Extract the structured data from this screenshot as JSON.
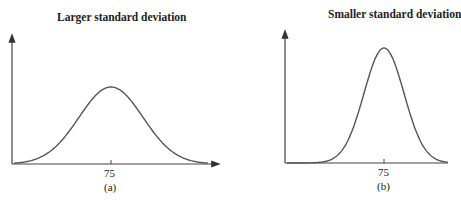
{
  "panels": [
    {
      "title": "Larger standard deviation",
      "tick": "75",
      "caption": "(a)"
    },
    {
      "title": "Smaller standard deviation",
      "tick": "75",
      "caption": "(b)"
    }
  ],
  "chart_data": [
    {
      "type": "line",
      "title": "Larger standard deviation",
      "subtitle": "(a)",
      "xlabel": "",
      "ylabel": "",
      "x_ticks": [
        "75"
      ],
      "mean": 75,
      "relative_spread": "larger",
      "description": "Normal distribution curve centered at 75, wider and shorter",
      "grid": false
    },
    {
      "type": "line",
      "title": "Smaller standard deviation",
      "subtitle": "(b)",
      "xlabel": "",
      "ylabel": "",
      "x_ticks": [
        "75"
      ],
      "mean": 75,
      "relative_spread": "smaller",
      "description": "Normal distribution curve centered at 75, narrower and taller",
      "grid": false
    }
  ]
}
